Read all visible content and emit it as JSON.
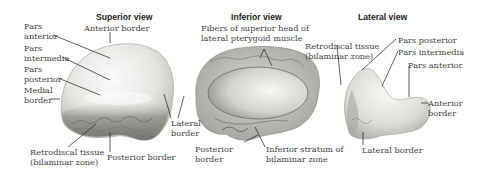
{
  "figure": {
    "views": [
      {
        "id": "superior",
        "title": "Superior view",
        "labels": {
          "anterior_border": "Anterior border",
          "pars_anterior": [
            "Pars",
            "anterior"
          ],
          "pars_intermedia": [
            "Pars",
            "intermedia"
          ],
          "pars_posterior": [
            "Pars",
            "posterior"
          ],
          "medial_border": [
            "Medial",
            "border"
          ],
          "lateral_border": [
            "Lateral",
            "border"
          ],
          "retrodiscal_tissue": [
            "Retrodiscal tissue",
            "(bilaminar zone)"
          ],
          "posterior_border": "Posterior border"
        }
      },
      {
        "id": "inferior",
        "title": "Inferior view",
        "labels": {
          "lateral_pterygoid_fibers": [
            "Fibers of superior head of",
            "lateral pterygoid muscle"
          ],
          "posterior_border": [
            "Posterior",
            "border"
          ],
          "inferior_stratum": [
            "Inferior stratum of",
            "bilaminar zone"
          ]
        }
      },
      {
        "id": "lateral",
        "title": "Lateral view",
        "labels": {
          "retrodiscal_tissue": [
            "Retrodiscal tissue",
            "(bilaminar zone)"
          ],
          "pars_posterior": "Pars posterior",
          "pars_intermedia": "Pars intermedia",
          "pars_anterior": "Pars anterior",
          "anterior_border": [
            "Anterior",
            "border"
          ],
          "lateral_border": "Lateral border"
        }
      }
    ],
    "colors": {
      "disc_light": "#f2f2f0",
      "disc_mid": "#c9c9c6",
      "disc_dark": "#7d7d7a",
      "leader_line": "#2a2a2a",
      "text": "#3e3e3e"
    }
  }
}
